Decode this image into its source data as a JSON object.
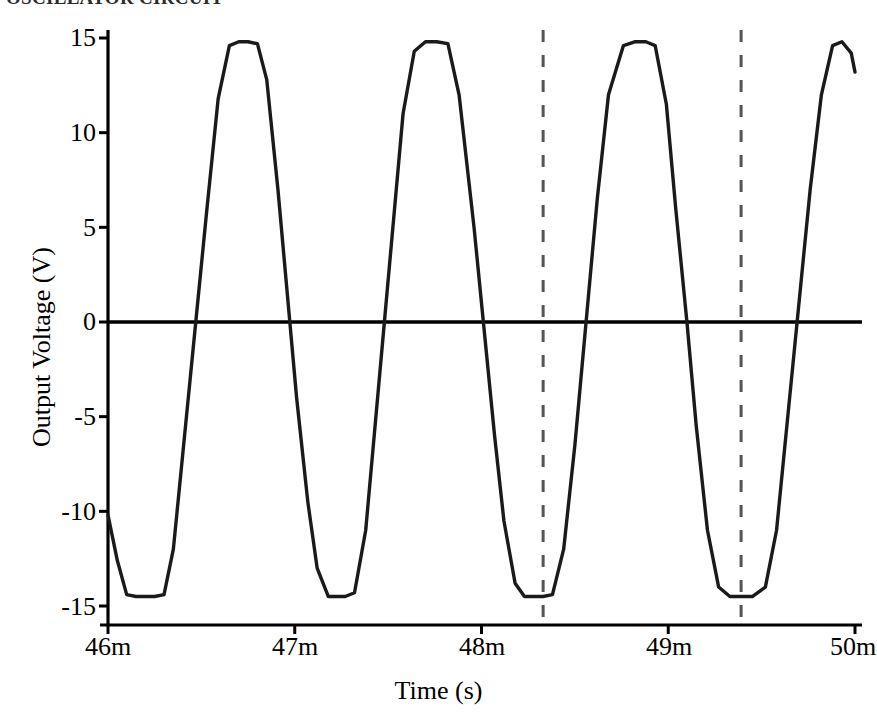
{
  "figure": {
    "title_partial": "OSCILLATOR CIRCUIT",
    "background": "#ffffff",
    "trace_color": "#1a1a1a",
    "axis_color": "#000000",
    "marker_color": "#555555"
  },
  "axes": {
    "x_title": "Time (s)",
    "y_title": "Output Voltage (V)",
    "x_ticklabels": [
      "46m",
      "47m",
      "48m",
      "49m",
      "50m"
    ],
    "y_ticklabels": [
      "15",
      "10",
      "5",
      "0",
      "-5",
      "-10",
      "-15"
    ]
  },
  "chart_data": {
    "type": "line",
    "title": "OSCILLATOR CIRCUIT",
    "xlabel": "Time (s)",
    "ylabel": "Output Voltage (V)",
    "xlim": [
      0.046,
      0.05
    ],
    "ylim": [
      -15.8,
      15.8
    ],
    "x_ticks": [
      0.046,
      0.047,
      0.048,
      0.049,
      0.05
    ],
    "x_ticklabels": [
      "46m",
      "47m",
      "48m",
      "49m",
      "50m"
    ],
    "y_ticks": [
      15,
      10,
      5,
      0,
      -5,
      -10,
      -15
    ],
    "y_ticklabels": [
      "15",
      "10",
      "5",
      "0",
      "-5",
      "-10",
      "-15"
    ],
    "grid": false,
    "legend": null,
    "series": [
      {
        "name": "Output Voltage",
        "waveform": "clipped-sine",
        "period_s": 0.0005,
        "frequency_hz": 2000,
        "amplitude_pos_v": 14.8,
        "amplitude_neg_v": -14.5,
        "phase_note": "starts near -10 V rising-from / falling-into negative clip at t=46m",
        "start_value_v": -10.2,
        "end_value_v": 13.2,
        "zero_crossings_s": [
          0.04641,
          0.04696,
          0.04742,
          0.04796,
          0.04842,
          0.04896,
          0.04942,
          0.04996
        ],
        "positive_clip_centers_s": [
          0.04672,
          0.04772,
          0.04872,
          0.04972
        ],
        "negative_clip_centers_s": [
          0.04618,
          0.04722,
          0.04822,
          0.04922
        ],
        "x": [
          0.046,
          0.04605,
          0.0461,
          0.04615,
          0.0462,
          0.04625,
          0.0463,
          0.04635,
          0.04641,
          0.04647,
          0.04653,
          0.04659,
          0.04665,
          0.0467,
          0.04675,
          0.0468,
          0.04685,
          0.04691,
          0.04696,
          0.04701,
          0.04707,
          0.04712,
          0.04718,
          0.04722,
          0.04727,
          0.04732,
          0.04738,
          0.04743,
          0.04748,
          0.04753,
          0.04758,
          0.04764,
          0.0477,
          0.04776,
          0.04782,
          0.04788,
          0.04796,
          0.04801,
          0.04807,
          0.04812,
          0.04818,
          0.04823,
          0.04828,
          0.04833,
          0.04838,
          0.04844,
          0.0485,
          0.04856,
          0.04862,
          0.04868,
          0.04876,
          0.04882,
          0.04888,
          0.04893,
          0.04899,
          0.04904,
          0.0491,
          0.04915,
          0.04921,
          0.04927,
          0.04933,
          0.04939,
          0.04945,
          0.04952,
          0.04958,
          0.04964,
          0.0497,
          0.04976,
          0.04982,
          0.04988,
          0.04993,
          0.04998,
          0.05
        ],
        "y": [
          -10.2,
          -12.6,
          -14.4,
          -14.5,
          -14.5,
          -14.5,
          -14.4,
          -12.0,
          -6.0,
          0.0,
          6.0,
          11.8,
          14.6,
          14.8,
          14.8,
          14.7,
          12.8,
          7.0,
          1.5,
          -4.0,
          -9.5,
          -13.0,
          -14.5,
          -14.5,
          -14.5,
          -14.3,
          -11.0,
          -5.5,
          0.0,
          5.5,
          11.0,
          14.3,
          14.8,
          14.8,
          14.7,
          12.0,
          5.0,
          0.0,
          -6.0,
          -10.5,
          -13.8,
          -14.5,
          -14.5,
          -14.5,
          -14.4,
          -12.0,
          -6.5,
          0.0,
          6.5,
          12.0,
          14.6,
          14.8,
          14.8,
          14.6,
          11.5,
          6.0,
          0.0,
          -5.5,
          -11.0,
          -14.0,
          -14.5,
          -14.5,
          -14.5,
          -14.0,
          -11.0,
          -5.0,
          1.0,
          7.0,
          12.0,
          14.6,
          14.8,
          14.2,
          13.2
        ]
      }
    ],
    "annotations": [
      {
        "type": "vertical-dashed-line",
        "label": "cursor-1",
        "x": 0.04833,
        "color": "#555555"
      },
      {
        "type": "vertical-dashed-line",
        "label": "cursor-2",
        "x": 0.04939,
        "color": "#555555"
      }
    ]
  }
}
